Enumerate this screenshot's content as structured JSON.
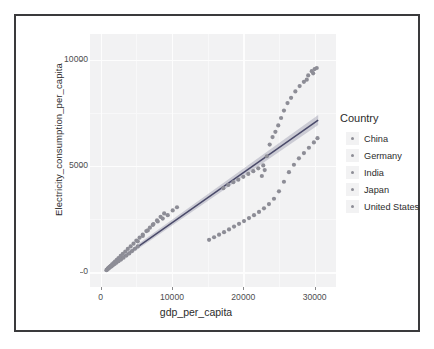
{
  "chart_data": {
    "type": "scatter",
    "title": "",
    "xlabel": "gdp_per_capita",
    "ylabel": "Electricity_consumption_per_capita",
    "xlim": [
      -1500,
      33000
    ],
    "ylim": [
      -700,
      11200
    ],
    "xticks": [
      0,
      10000,
      20000,
      30000
    ],
    "xtick_labels": [
      "0",
      "10000",
      "20000",
      "30000"
    ],
    "yticks": [
      0,
      5000,
      10000
    ],
    "ytick_labels": [
      "0",
      "5000",
      "10000"
    ],
    "grid": true,
    "grid_color": "#fdfdfd",
    "panel_background": "#f2f2f3",
    "legend_position": "right",
    "legend_title": "Country",
    "regression": {
      "show": true,
      "line_color": "#4a4a6a",
      "band_color": "#9b9bb0",
      "x0": 900,
      "y0": 180,
      "x1": 30500,
      "y1": 7150
    },
    "series": [
      {
        "name": "China",
        "color": "#8d8d96",
        "points": [
          [
            900,
            120
          ],
          [
            1000,
            160
          ],
          [
            1100,
            200
          ],
          [
            1250,
            250
          ],
          [
            1400,
            300
          ],
          [
            1600,
            360
          ],
          [
            1800,
            430
          ],
          [
            2000,
            500
          ],
          [
            2250,
            580
          ],
          [
            2500,
            660
          ],
          [
            2800,
            760
          ],
          [
            3100,
            860
          ],
          [
            3450,
            970
          ],
          [
            3800,
            1090
          ],
          [
            4200,
            1210
          ],
          [
            4600,
            1340
          ],
          [
            5000,
            1480
          ],
          [
            5450,
            1620
          ],
          [
            5900,
            1770
          ],
          [
            6400,
            1930
          ],
          [
            6900,
            2090
          ],
          [
            7400,
            2260
          ],
          [
            7900,
            2430
          ],
          [
            8400,
            2600
          ],
          [
            8900,
            2760
          ]
        ]
      },
      {
        "name": "Germany",
        "color": "#8d8d96",
        "points": [
          [
            15200,
            1520
          ],
          [
            15900,
            1640
          ],
          [
            16600,
            1760
          ],
          [
            17300,
            1880
          ],
          [
            18000,
            2010
          ],
          [
            18700,
            2140
          ],
          [
            19400,
            2270
          ],
          [
            20100,
            2400
          ],
          [
            20800,
            2540
          ],
          [
            21500,
            2680
          ],
          [
            22200,
            2830
          ],
          [
            22900,
            3000
          ],
          [
            23600,
            3200
          ],
          [
            24300,
            3450
          ],
          [
            25000,
            3800
          ],
          [
            25700,
            4250
          ],
          [
            26400,
            4700
          ],
          [
            27100,
            5050
          ],
          [
            27800,
            5350
          ],
          [
            28500,
            5600
          ],
          [
            29200,
            5850
          ],
          [
            29900,
            6100
          ],
          [
            30400,
            6300
          ]
        ]
      },
      {
        "name": "India",
        "color": "#8d8d96",
        "points": [
          [
            800,
            90
          ],
          [
            900,
            120
          ],
          [
            1000,
            150
          ],
          [
            1150,
            185
          ],
          [
            1300,
            225
          ],
          [
            1500,
            270
          ],
          [
            1700,
            320
          ],
          [
            1950,
            380
          ],
          [
            2200,
            440
          ],
          [
            2500,
            510
          ],
          [
            2850,
            590
          ],
          [
            3200,
            680
          ],
          [
            3600,
            780
          ],
          [
            4000,
            880
          ],
          [
            4400,
            990
          ],
          [
            4800,
            1100
          ],
          [
            5200,
            1210
          ]
        ]
      },
      {
        "name": "Japan",
        "color": "#8d8d96",
        "points": [
          [
            5200,
            1450
          ],
          [
            5900,
            1700
          ],
          [
            6600,
            1960
          ],
          [
            7300,
            2220
          ],
          [
            8000,
            2380
          ],
          [
            8700,
            2520
          ],
          [
            9400,
            2680
          ],
          [
            10100,
            2900
          ],
          [
            10700,
            3050
          ],
          [
            17200,
            3950
          ],
          [
            17900,
            4100
          ],
          [
            18600,
            4230
          ],
          [
            19300,
            4350
          ],
          [
            20000,
            4480
          ],
          [
            20700,
            4620
          ],
          [
            21400,
            4750
          ],
          [
            22100,
            4880
          ],
          [
            22800,
            5020
          ]
        ]
      },
      {
        "name": "United States",
        "color": "#8d8d96",
        "points": [
          [
            22600,
            4520
          ],
          [
            23000,
            4800
          ],
          [
            23300,
            5450
          ],
          [
            23700,
            6000
          ],
          [
            24100,
            6350
          ],
          [
            24500,
            6600
          ],
          [
            24900,
            6900
          ],
          [
            25300,
            7250
          ],
          [
            25700,
            7600
          ],
          [
            26200,
            7950
          ],
          [
            26700,
            8200
          ],
          [
            27300,
            8500
          ],
          [
            27900,
            8750
          ],
          [
            28500,
            8950
          ],
          [
            29100,
            9250
          ],
          [
            29600,
            9450
          ],
          [
            30000,
            9550
          ],
          [
            30300,
            9600
          ],
          [
            29800,
            9350
          ],
          [
            28900,
            9050
          ]
        ]
      }
    ],
    "legend_entries": [
      {
        "label": "China",
        "color": "#8d8d96"
      },
      {
        "label": "Germany",
        "color": "#8d8d96"
      },
      {
        "label": "India",
        "color": "#8d8d96"
      },
      {
        "label": "Japan",
        "color": "#8d8d96"
      },
      {
        "label": "United States",
        "color": "#8d8d96"
      }
    ]
  },
  "frame": {
    "border_color": "#3a3a3c"
  }
}
